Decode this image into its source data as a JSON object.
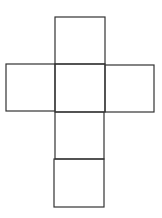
{
  "diagram": {
    "type": "cube-net",
    "shape": "cross",
    "stroke_color": "#333333",
    "background": "#ffffff",
    "faces": [
      {
        "id": "top",
        "x": 55,
        "y": 17,
        "w": 50,
        "h": 47
      },
      {
        "id": "left",
        "x": 6,
        "y": 64,
        "w": 49,
        "h": 47
      },
      {
        "id": "center",
        "x": 55,
        "y": 64,
        "w": 50,
        "h": 48
      },
      {
        "id": "right",
        "x": 105,
        "y": 65,
        "w": 49,
        "h": 47
      },
      {
        "id": "lower",
        "x": 55,
        "y": 112,
        "w": 49,
        "h": 47
      },
      {
        "id": "bottom",
        "x": 54,
        "y": 159,
        "w": 50,
        "h": 48
      }
    ]
  }
}
